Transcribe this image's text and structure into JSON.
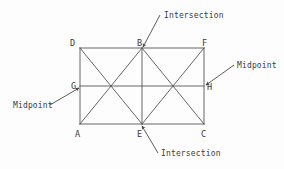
{
  "figure": {
    "background_color": "#fdfdfd",
    "stroke_color": "#555555",
    "text_color": "#3a3a3a",
    "canvas": {
      "width": 284,
      "height": 169
    }
  },
  "vertices": {
    "D": {
      "label": "D",
      "x": 80,
      "y": 48,
      "label_x": 70,
      "label_y": 46
    },
    "B": {
      "label": "B",
      "x": 142,
      "y": 48,
      "label_x": 137,
      "label_y": 46
    },
    "F": {
      "label": "F",
      "x": 204,
      "y": 48,
      "label_x": 202,
      "label_y": 46
    },
    "G": {
      "label": "G",
      "x": 80,
      "y": 86,
      "label_x": 71,
      "label_y": 89
    },
    "H": {
      "label": "H",
      "x": 204,
      "y": 86,
      "label_x": 207,
      "label_y": 90
    },
    "A": {
      "label": "A",
      "x": 80,
      "y": 124,
      "label_x": 75,
      "label_y": 137
    },
    "E": {
      "label": "E",
      "x": 142,
      "y": 124,
      "label_x": 137,
      "label_y": 137
    },
    "C": {
      "label": "C",
      "x": 204,
      "y": 124,
      "label_x": 201,
      "label_y": 137
    }
  },
  "annotations": [
    {
      "id": "intersection-top",
      "text": "Intersection",
      "text_x": 164,
      "text_y": 18,
      "leader_from_x": 160,
      "leader_from_y": 15,
      "leader_to_x": 143,
      "leader_to_y": 47,
      "arrow": true
    },
    {
      "id": "midpoint-right",
      "text": "Midpoint",
      "text_x": 237,
      "text_y": 68,
      "leader_from_x": 234,
      "leader_from_y": 65,
      "leader_to_x": 206,
      "leader_to_y": 85,
      "arrow": true
    },
    {
      "id": "midpoint-left",
      "text": "Midpoint",
      "text_x": 13,
      "text_y": 108,
      "leader_from_x": 50,
      "leader_from_y": 105,
      "leader_to_x": 79,
      "leader_to_y": 88,
      "arrow": true
    },
    {
      "id": "intersection-bottom",
      "text": "Intersection",
      "text_x": 161,
      "text_y": 156,
      "leader_from_x": 158,
      "leader_from_y": 153,
      "leader_to_x": 142,
      "leader_to_y": 126,
      "arrow": true
    }
  ],
  "segments": [
    {
      "id": "edge-top-DF",
      "x1": 80,
      "y1": 48,
      "x2": 204,
      "y2": 48
    },
    {
      "id": "edge-bottom-AC",
      "x1": 80,
      "y1": 124,
      "x2": 204,
      "y2": 124
    },
    {
      "id": "edge-left-DA",
      "x1": 80,
      "y1": 48,
      "x2": 80,
      "y2": 124
    },
    {
      "id": "edge-right-FC",
      "x1": 204,
      "y1": 48,
      "x2": 204,
      "y2": 124
    },
    {
      "id": "midline-GH",
      "x1": 80,
      "y1": 86,
      "x2": 204,
      "y2": 86
    },
    {
      "id": "vertical-BE",
      "x1": 142,
      "y1": 48,
      "x2": 142,
      "y2": 124
    },
    {
      "id": "diagonal-DE",
      "x1": 80,
      "y1": 48,
      "x2": 142,
      "y2": 124
    },
    {
      "id": "diagonal-AB",
      "x1": 80,
      "y1": 124,
      "x2": 142,
      "y2": 48
    },
    {
      "id": "diagonal-BC",
      "x1": 142,
      "y1": 48,
      "x2": 204,
      "y2": 124
    },
    {
      "id": "diagonal-EF",
      "x1": 142,
      "y1": 124,
      "x2": 204,
      "y2": 48
    }
  ]
}
